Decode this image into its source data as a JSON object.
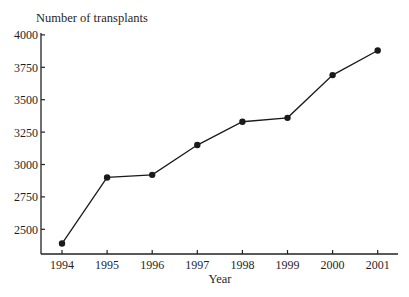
{
  "chart_data": {
    "type": "line",
    "title": "",
    "ylabel": "Number of transplants",
    "xlabel": "Year",
    "categories": [
      "1994",
      "1995",
      "1996",
      "1997",
      "1998",
      "1999",
      "2000",
      "2001"
    ],
    "series": [
      {
        "name": "Number of transplants",
        "values": [
          2390,
          2900,
          2920,
          3150,
          3330,
          3360,
          3690,
          3880
        ],
        "marker": "filled-circle",
        "color": "#1a1a1a"
      }
    ],
    "yticks": [
      2500,
      2750,
      3000,
      3250,
      3500,
      3750,
      4000
    ],
    "ylim": [
      2300,
      4000
    ],
    "grid": false,
    "legend": "none"
  }
}
